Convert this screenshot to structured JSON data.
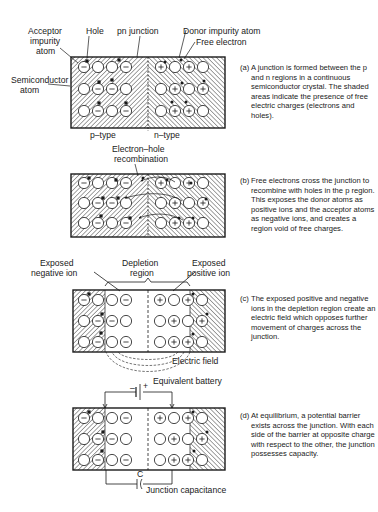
{
  "figure": {
    "panels": [
      {
        "id": "a",
        "tag": "(a)",
        "caption": "A junction is formed between the p and n regions in a continuous semiconductor crystal. The shaded areas indicate the presence of free electric charges (electrons and holes).",
        "labels": {
          "acceptor": "Acceptor impurity atom",
          "acceptor_l1": "Acceptor",
          "acceptor_l2": "impurity",
          "acceptor_l3": "atom",
          "hole": "Hole",
          "pn_junction": "pn junction",
          "donor": "Donor impurity atom",
          "free_electron": "Free electron",
          "semiconductor_l1": "Semiconductor",
          "semiconductor_l2": "atom",
          "p_type": "p–type",
          "n_type": "n–type"
        }
      },
      {
        "id": "b",
        "tag": "(b)",
        "caption": "Free electrons cross the junction to recombine with holes in the p region. This exposes the donor atoms as positive ions and the acceptor atoms as negative ions, and creates a region void of free charges.",
        "labels": {
          "recombination_l1": "Electron–hole",
          "recombination_l2": "recombination"
        }
      },
      {
        "id": "c",
        "tag": "(c)",
        "caption": "The exposed positive and negative ions in the depletion region create an electric field which opposes further movement of charges across the junction.",
        "labels": {
          "neg_ion_l1": "Exposed",
          "neg_ion_l2": "negative ion",
          "depletion_l1": "Depletion",
          "depletion_l2": "region",
          "pos_ion_l1": "Exposed",
          "pos_ion_l2": "positive ion",
          "electric_field": "Electric field"
        }
      },
      {
        "id": "d",
        "tag": "(d)",
        "caption": "At equilibrium, a potential barrier exists across the junction. With each side of the barrier at opposite charge with respect to the other, the junction possesses capacity.",
        "labels": {
          "battery": "Equivalent battery",
          "minus": "–",
          "plus": "+",
          "capacitor": "C",
          "capacitance": "Junction capacitance"
        }
      }
    ],
    "colors": {
      "ink": "#1a1a1a",
      "paper": "#ffffff"
    }
  }
}
